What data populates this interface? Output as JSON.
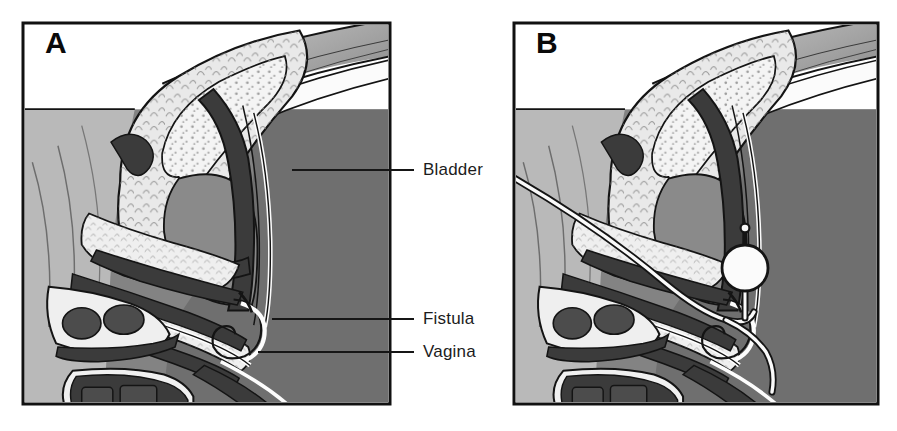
{
  "figure": {
    "width": 897,
    "height": 431,
    "background_color": "#ffffff"
  },
  "panels": [
    {
      "id": "A",
      "letter": "A",
      "caption_note": "Fistulous tract between bladder and vagina",
      "frame": {
        "x": 23,
        "y": 23,
        "width": 367,
        "height": 381
      }
    },
    {
      "id": "B",
      "letter": "B",
      "caption_note": "Foley catheter balloon placed through fistula",
      "frame": {
        "x": 514,
        "y": 23,
        "width": 364,
        "height": 381
      }
    }
  ],
  "annotations": [
    {
      "key": "bladder",
      "label": "Bladder",
      "text_x": 423,
      "text_y": 170,
      "leader": {
        "x1": 292,
        "y1": 170,
        "x2": 414,
        "y2": 170
      }
    },
    {
      "key": "fistula",
      "label": "Fistula",
      "text_x": 423,
      "text_y": 320,
      "leader": {
        "x1": 272,
        "y1": 319,
        "x2": 414,
        "y2": 319
      }
    },
    {
      "key": "vagina",
      "label": "Vagina",
      "text_x": 423,
      "text_y": 352,
      "leader": {
        "x1": 258,
        "y1": 352,
        "x2": 414,
        "y2": 352
      }
    }
  ],
  "instrument": {
    "name": "foley-catheter",
    "balloon_label": "Foley balloon",
    "tube_label": "Catheter tube",
    "balloon_center": {
      "x": 745,
      "y": 268
    },
    "balloon_radius": 23,
    "present_in_panel": "B"
  },
  "structures": [
    {
      "key": "uterus",
      "label": "Uterus",
      "fill": "#e9e9e9"
    },
    {
      "key": "endometrial-cavity",
      "label": "Endometrial cavity",
      "fill": "#f4f4f4"
    },
    {
      "key": "bladder-lumen",
      "label": "Bladder lumen",
      "fill": "#8a8a8a"
    },
    {
      "key": "bladder-wall",
      "label": "Bladder wall",
      "fill": "#3b3b3b"
    },
    {
      "key": "vaginal-canal",
      "label": "Vaginal canal",
      "fill": "#fdfdfd"
    },
    {
      "key": "vaginal-wall",
      "label": "Vaginal wall",
      "fill": "#3f3f3f"
    },
    {
      "key": "pubic-symphysis",
      "label": "Pubic symphysis",
      "fill": "#efefef"
    },
    {
      "key": "abdominal-wall",
      "label": "Abdominal wall",
      "fill": "#b9b9b9"
    },
    {
      "key": "pelvic-soft-tissue",
      "label": "Pelvic soft tissue",
      "fill": "#838383"
    },
    {
      "key": "sacrum",
      "label": "Sacrum / posterior tissue",
      "fill": "#6f6f6f"
    }
  ],
  "palette": {
    "white": "#ffffff",
    "light_gray": "#b9b9b9",
    "mid_gray": "#838383",
    "dark_gray": "#6f6f6f",
    "organ_light": "#e9e9e9",
    "organ_pale": "#f4f4f4",
    "wall_dark": "#3b3b3b",
    "outline": "#121212",
    "label_text": "#1c1c1c",
    "bladder_lumen": "#8a8a8a"
  },
  "artifacts": {
    "bottom_ghost_note": "faint illegible scanned caption remnant beneath panels"
  }
}
